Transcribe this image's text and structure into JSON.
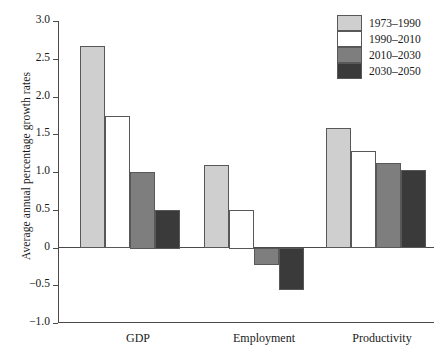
{
  "chart_data": {
    "type": "bar",
    "title": "",
    "subtitle": "",
    "xlabel": "",
    "ylabel": "Average annual percentage growth rates",
    "categories": [
      "GDP",
      "Employment",
      "Productivity"
    ],
    "series": [
      {
        "name": "1973–1990",
        "color": "#cfcfcf",
        "values": [
          2.67,
          1.09,
          1.58
        ]
      },
      {
        "name": "1990–2010",
        "color": "#ffffff",
        "values": [
          1.74,
          0.5,
          1.28
        ]
      },
      {
        "name": "2010–2030",
        "color": "#7e7e7e",
        "values": [
          1.0,
          -0.22,
          1.12
        ]
      },
      {
        "name": "2030–2050",
        "color": "#3a3a3a",
        "values": [
          0.5,
          -0.55,
          1.03
        ]
      }
    ],
    "ylim": [
      -1.0,
      3.0
    ],
    "ytick_labels": [
      "3.0",
      "2.5",
      "2.0",
      "1.5",
      "1.0",
      "0.5",
      "0",
      "−0.5",
      "−1.0"
    ],
    "ytick_values": [
      3.0,
      2.5,
      2.0,
      1.5,
      1.0,
      0.5,
      0.0,
      -0.5,
      -1.0
    ],
    "grid": false,
    "legend_position": "top-right",
    "zero_line": true
  },
  "legend": {
    "entries": [
      {
        "label": "1973–1990",
        "swatch": "light-gray-swatch"
      },
      {
        "label": "1990–2010",
        "swatch": "white-swatch"
      },
      {
        "label": "2010–2030",
        "swatch": "medium-gray-swatch"
      },
      {
        "label": "2030–2050",
        "swatch": "dark-gray-swatch"
      }
    ]
  },
  "axes": {
    "y_title": "Average annual percentage growth rates",
    "x_categories": [
      "GDP",
      "Employment",
      "Productivity"
    ],
    "y_ticks": [
      "3.0",
      "2.5",
      "2.0",
      "1.5",
      "1.0",
      "0.5",
      "0",
      "−0.5",
      "−1.0"
    ]
  }
}
